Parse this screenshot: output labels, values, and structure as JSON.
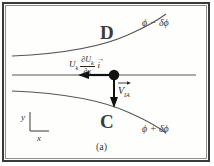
{
  "figure": {
    "caption": "(a)",
    "regions": [
      {
        "id": "upper",
        "label": "D"
      },
      {
        "id": "lower",
        "label": "C"
      }
    ],
    "isolines": [
      {
        "id": "upper-isoline",
        "label": "ϕ − δϕ"
      },
      {
        "id": "lower-isoline",
        "label": "ϕ + δϕ"
      }
    ],
    "vectors": {
      "convection": {
        "leading_symbol": "U",
        "leading_subscript": "k",
        "numerator": "∂U",
        "numerator_subscript": "k",
        "denominator": "∂x",
        "unit_vector": "i",
        "unit_vector_hat": "→",
        "direction": "left"
      },
      "normal_velocity": {
        "symbol": "V",
        "subscript": "IA",
        "direction": "down"
      }
    },
    "axes": {
      "y_label": "y",
      "x_label": "x"
    },
    "colors": {
      "frame": "#3a3a3a",
      "inner_frame": "#8f8f8f",
      "background": "#fefefc",
      "stroke": "#555555",
      "accent": "#111111"
    }
  }
}
